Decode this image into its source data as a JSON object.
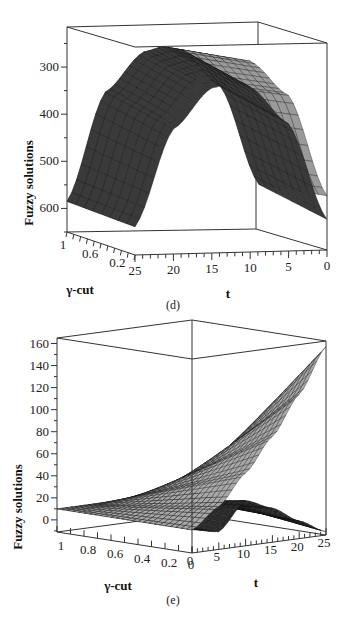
{
  "chart_data": [
    {
      "id": "d",
      "type": "surface3d",
      "caption": "(d)",
      "zlabel": "Fuzzy solutions",
      "xlabel": "t",
      "ylabel": "γ-cut",
      "z_ticks": [
        "300",
        "400",
        "500",
        "600"
      ],
      "z_tick_values": [
        300,
        400,
        500,
        600
      ],
      "t_ticks": [
        "25",
        "20",
        "15",
        "10",
        "5",
        "0"
      ],
      "t_tick_values": [
        25,
        20,
        15,
        10,
        5,
        0
      ],
      "gamma_ticks": [
        "1",
        "0.6",
        "0.2"
      ],
      "gamma_tick_values": [
        1,
        0.6,
        0.2
      ],
      "zlim": [
        650,
        215
      ],
      "tlim": [
        0,
        25
      ],
      "gammalim": [
        0,
        1
      ],
      "z_axis_inverted": true,
      "surfaces": [
        {
          "name": "lower bound",
          "t": [
            0,
            5,
            10,
            12.5,
            15,
            20,
            25
          ],
          "z_at_gamma0": [
            535,
            320,
            245,
            240,
            248,
            330,
            590
          ],
          "z_at_gamma1": [
            560,
            350,
            270,
            262,
            272,
            355,
            585
          ]
        },
        {
          "name": "upper bound",
          "t": [
            0,
            5,
            10,
            12.5,
            15,
            20,
            25
          ],
          "z_at_gamma0": [
            585,
            380,
            300,
            290,
            300,
            385,
            590
          ],
          "z_at_gamma1": [
            560,
            350,
            270,
            262,
            272,
            355,
            585
          ]
        }
      ]
    },
    {
      "id": "e",
      "type": "surface3d",
      "caption": "(e)",
      "zlabel": "Fuzzy solutions",
      "xlabel": "t",
      "ylabel": "γ-cut",
      "z_ticks": [
        "0",
        "20",
        "40",
        "60",
        "80",
        "100",
        "120",
        "140",
        "160"
      ],
      "z_tick_values": [
        0,
        20,
        40,
        60,
        80,
        100,
        120,
        140,
        160
      ],
      "t_ticks": [
        "0",
        "5",
        "10",
        "15",
        "20",
        "25"
      ],
      "t_tick_values": [
        0,
        5,
        10,
        15,
        20,
        25
      ],
      "gamma_ticks": [
        "1",
        "0.8",
        "0.6",
        "0.4",
        "0.2",
        "0"
      ],
      "gamma_tick_values": [
        1,
        0.8,
        0.6,
        0.4,
        0.2,
        0
      ],
      "zlim": [
        -11,
        165
      ],
      "tlim": [
        0,
        25
      ],
      "gammalim": [
        0,
        1
      ],
      "surfaces": [
        {
          "name": "upper bound",
          "t": [
            0,
            5,
            10,
            15,
            20,
            25
          ],
          "z_at_gamma0": [
            10,
            28,
            55,
            85,
            120,
            160
          ],
          "z_at_gamma1": [
            10,
            10,
            10,
            10,
            10,
            10
          ]
        },
        {
          "name": "lower bound",
          "t": [
            0,
            5,
            10,
            15,
            20,
            25
          ],
          "z_at_gamma0": [
            10,
            5,
            30,
            20,
            5,
            -8
          ],
          "z_at_gamma1": [
            10,
            10,
            10,
            10,
            10,
            10
          ]
        }
      ]
    }
  ]
}
